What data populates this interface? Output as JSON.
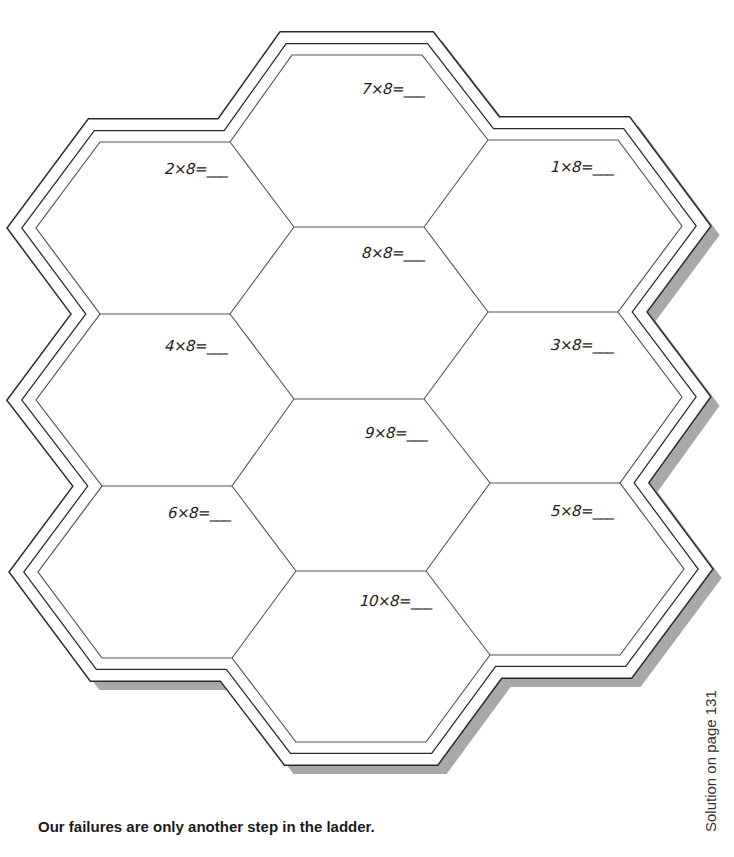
{
  "worksheet": {
    "problems": [
      {
        "id": "7x8",
        "label": "7×8=___",
        "x": 362,
        "y": 80
      },
      {
        "id": "2x8",
        "label": "2×8=___",
        "x": 165,
        "y": 160
      },
      {
        "id": "1x8",
        "label": "1×8=___",
        "x": 551,
        "y": 158
      },
      {
        "id": "8x8",
        "label": "8×8=___",
        "x": 362,
        "y": 244
      },
      {
        "id": "4x8",
        "label": "4×8=___",
        "x": 165,
        "y": 337
      },
      {
        "id": "3x8",
        "label": "3×8=___",
        "x": 551,
        "y": 336
      },
      {
        "id": "9x8",
        "label": "9×8=___",
        "x": 365,
        "y": 424
      },
      {
        "id": "6x8",
        "label": "6×8=___",
        "x": 168,
        "y": 504
      },
      {
        "id": "5x8",
        "label": "5×8=___",
        "x": 551,
        "y": 502
      },
      {
        "id": "10x8",
        "label": "10×8=___",
        "x": 360,
        "y": 592
      }
    ],
    "colors": {
      "line": "#333333",
      "shadow": "#a8a8a8"
    }
  },
  "footer": {
    "quote": "Our failures are only another step in the ladder.",
    "solution_note": "Solution on page 131"
  }
}
